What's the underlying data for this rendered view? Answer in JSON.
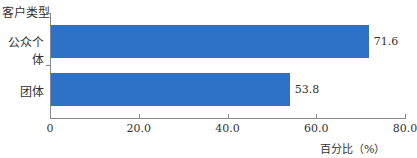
{
  "chart_data": {
    "type": "bar",
    "orientation": "horizontal",
    "title": "",
    "ylabel": "客户类型",
    "xlabel": "百分比（%）",
    "categories": [
      "公众个体",
      "团体"
    ],
    "values": [
      71.6,
      53.8
    ],
    "value_labels": [
      "71.6",
      "53.8"
    ],
    "xlim": [
      0,
      80
    ],
    "xticks": [
      "0",
      "20.0",
      "40.0",
      "60.0",
      "80.0"
    ],
    "bar_color": "#2d72c4",
    "grid": false,
    "legend": null
  }
}
